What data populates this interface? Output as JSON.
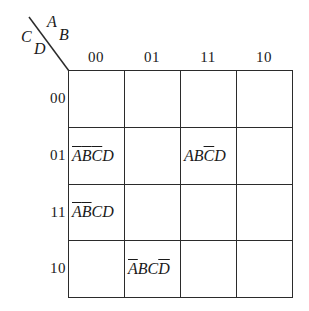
{
  "diagram": {
    "type": "karnaugh-map",
    "variables": {
      "column_vars": [
        "A",
        "B"
      ],
      "row_vars": [
        "C",
        "D"
      ],
      "letter_a": "A",
      "letter_b": "B",
      "letter_c": "C",
      "letter_d": "D"
    },
    "column_headers": [
      "00",
      "01",
      "11",
      "10"
    ],
    "row_headers": [
      "00",
      "01",
      "11",
      "10"
    ],
    "cells": [
      [
        {
          "text": "",
          "parts": []
        },
        {
          "text": "",
          "parts": []
        },
        {
          "text": "",
          "parts": []
        },
        {
          "text": "",
          "parts": []
        }
      ],
      [
        {
          "text": "ABCD",
          "parts": [
            {
              "t": "A",
              "bar": true
            },
            {
              "t": "B",
              "bar": true
            },
            {
              "t": "C",
              "bar": true
            },
            {
              "t": "D",
              "bar": false
            }
          ]
        },
        {
          "text": "",
          "parts": []
        },
        {
          "text": "ABCD",
          "parts": [
            {
              "t": "A",
              "bar": false
            },
            {
              "t": "B",
              "bar": false
            },
            {
              "t": "C",
              "bar": true
            },
            {
              "t": "D",
              "bar": false
            }
          ]
        },
        {
          "text": "",
          "parts": []
        }
      ],
      [
        {
          "text": "ABCD",
          "parts": [
            {
              "t": "A",
              "bar": true
            },
            {
              "t": "B",
              "bar": true
            },
            {
              "t": "C",
              "bar": false
            },
            {
              "t": "D",
              "bar": false
            }
          ]
        },
        {
          "text": "",
          "parts": []
        },
        {
          "text": "",
          "parts": []
        },
        {
          "text": "",
          "parts": []
        }
      ],
      [
        {
          "text": "",
          "parts": []
        },
        {
          "text": "ABCD",
          "parts": [
            {
              "t": "A",
              "bar": true
            },
            {
              "t": "B",
              "bar": false
            },
            {
              "t": "C",
              "bar": false
            },
            {
              "t": "D",
              "bar": true
            }
          ]
        },
        {
          "text": "",
          "parts": []
        },
        {
          "text": "",
          "parts": []
        }
      ]
    ],
    "colors": {
      "line": "#2b2b2b",
      "text": "#1a1a1a",
      "background": "#ffffff"
    }
  }
}
